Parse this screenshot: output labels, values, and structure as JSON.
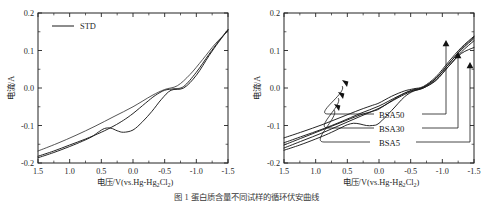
{
  "figure": {
    "caption": "图 1  蛋白质含量不同试样的循环伏安曲线",
    "panels": [
      "left",
      "right"
    ]
  },
  "axis": {
    "x_title_main": "电压/V(vs.Hg-Hg",
    "x_title_sub1": "2",
    "x_title_mid": "Cl",
    "x_title_sub2": "2",
    "x_title_end": ")",
    "y_title": "电流/A",
    "x_ticks": [
      "1.5",
      "1.0",
      "0.5",
      "0.0",
      "-0.5",
      "-1.0",
      "-1.5"
    ],
    "x_tick_values": [
      1.5,
      1.0,
      0.5,
      0.0,
      -0.5,
      -1.0,
      -1.5
    ],
    "y_ticks": [
      "0.2",
      "0.1",
      "0.0",
      "-0.1",
      "-0.2"
    ],
    "y_tick_values": [
      0.2,
      0.1,
      0.0,
      -0.1,
      -0.2
    ],
    "xlim": [
      1.5,
      -1.5
    ],
    "ylim": [
      -0.2,
      0.2
    ],
    "minor_tick_step_x": 0.25,
    "minor_tick_step_y": 0.05,
    "tick_direction": "inward",
    "grid": "off"
  },
  "left_panel": {
    "legend": {
      "label": "STD",
      "position": "top-left-inside"
    }
  },
  "right_panel": {
    "labels": [
      "BSA50",
      "BSA30",
      "BSA5"
    ]
  },
  "colors": {
    "curve": "#1a1a1a",
    "axis": "#232323",
    "text": "#1f1f1f",
    "background": "#ffffff"
  },
  "chart_data": {
    "type": "line",
    "title": "",
    "xlabel": "电压/V(vs.Hg-Hg2Cl2)",
    "ylabel": "电流/A",
    "xlim": [
      1.5,
      -1.5
    ],
    "ylim": [
      -0.2,
      0.2
    ],
    "x_reversed": true,
    "grid": false,
    "legend_position": "inside-top-left",
    "panels": [
      {
        "panel": "left",
        "legend": [
          "STD"
        ],
        "series": [
          {
            "name": "STD-forward",
            "comment": "anodic/forward sweep 1.5 -> -1.5",
            "x": [
              1.5,
              1.25,
              1.0,
              0.75,
              0.5,
              0.3,
              0.15,
              0.0,
              -0.2,
              -0.35,
              -0.5,
              -0.65,
              -0.8,
              -1.0,
              -1.2,
              -1.35,
              -1.5
            ],
            "y": [
              -0.182,
              -0.168,
              -0.152,
              -0.136,
              -0.118,
              -0.101,
              -0.086,
              -0.068,
              -0.04,
              -0.02,
              -0.006,
              -0.002,
              0.004,
              0.042,
              0.09,
              0.124,
              0.156
            ]
          },
          {
            "name": "STD-reverse",
            "comment": "cathodic/return sweep with reduction bump near 0.45 V",
            "x": [
              1.5,
              1.25,
              1.0,
              0.8,
              0.65,
              0.55,
              0.45,
              0.35,
              0.25,
              0.15,
              0.0,
              -0.15,
              -0.3,
              -0.45,
              -0.6,
              -0.8,
              -1.0,
              -1.2,
              -1.35,
              -1.5
            ],
            "y": [
              -0.186,
              -0.172,
              -0.156,
              -0.142,
              -0.13,
              -0.118,
              -0.108,
              -0.107,
              -0.114,
              -0.118,
              -0.112,
              -0.09,
              -0.062,
              -0.03,
              -0.006,
              0.0,
              0.034,
              0.086,
              0.122,
              0.155
            ]
          },
          {
            "name": "STD-upper",
            "comment": "upper hysteresis branch, nearly linear",
            "x": [
              1.5,
              1.2,
              0.9,
              0.6,
              0.3,
              0.0,
              -0.3,
              -0.5,
              -0.7,
              -0.9,
              -1.1,
              -1.3,
              -1.5
            ],
            "y": [
              -0.168,
              -0.148,
              -0.126,
              -0.102,
              -0.076,
              -0.05,
              -0.02,
              -0.004,
              0.006,
              0.036,
              0.076,
              0.118,
              0.152
            ]
          }
        ]
      },
      {
        "panel": "right",
        "legend": [
          "BSA50",
          "BSA30",
          "BSA5"
        ],
        "series": [
          {
            "name": "BSA50",
            "x": [
              1.5,
              1.2,
              0.9,
              0.6,
              0.3,
              0.1,
              0.0,
              -0.2,
              -0.4,
              -0.55,
              -0.7,
              -0.9,
              -1.1,
              -1.3,
              -1.5
            ],
            "y": [
              -0.133,
              -0.116,
              -0.098,
              -0.078,
              -0.058,
              -0.046,
              -0.04,
              -0.022,
              -0.008,
              -0.002,
              0.004,
              0.03,
              0.07,
              0.108,
              0.138
            ]
          },
          {
            "name": "BSA30",
            "x": [
              1.5,
              1.2,
              0.9,
              0.6,
              0.3,
              0.1,
              0.0,
              -0.2,
              -0.4,
              -0.55,
              -0.7,
              -0.9,
              -1.1,
              -1.3,
              -1.5
            ],
            "y": [
              -0.152,
              -0.132,
              -0.112,
              -0.092,
              -0.072,
              -0.062,
              -0.056,
              -0.034,
              -0.014,
              -0.004,
              0.002,
              0.026,
              0.064,
              0.102,
              0.132
            ]
          },
          {
            "name": "BSA5",
            "comment": "shows a reduction bump near 0.4 V",
            "x": [
              1.5,
              1.25,
              1.0,
              0.8,
              0.6,
              0.5,
              0.4,
              0.3,
              0.2,
              0.1,
              0.0,
              -0.2,
              -0.4,
              -0.55,
              -0.7,
              -0.9,
              -1.1,
              -1.3,
              -1.5
            ],
            "y": [
              -0.166,
              -0.152,
              -0.136,
              -0.122,
              -0.106,
              -0.098,
              -0.094,
              -0.096,
              -0.1,
              -0.1,
              -0.094,
              -0.06,
              -0.024,
              -0.008,
              0.0,
              0.02,
              0.058,
              0.092,
              0.108
            ]
          },
          {
            "name": "BSA50-return",
            "x": [
              1.5,
              1.2,
              0.9,
              0.6,
              0.3,
              0.0,
              -0.3,
              -0.5,
              -0.7,
              -0.9,
              -1.1,
              -1.3,
              -1.5
            ],
            "y": [
              -0.146,
              -0.128,
              -0.11,
              -0.09,
              -0.068,
              -0.048,
              -0.022,
              -0.008,
              0.002,
              0.026,
              0.064,
              0.104,
              0.136
            ]
          },
          {
            "name": "BSA30-return",
            "x": [
              1.5,
              1.2,
              0.9,
              0.6,
              0.3,
              0.0,
              -0.3,
              -0.5,
              -0.7,
              -0.9,
              -1.1,
              -1.3,
              -1.5
            ],
            "y": [
              -0.16,
              -0.14,
              -0.12,
              -0.098,
              -0.076,
              -0.054,
              -0.026,
              -0.01,
              0.0,
              0.022,
              0.058,
              0.096,
              0.126
            ]
          }
        ]
      }
    ]
  }
}
